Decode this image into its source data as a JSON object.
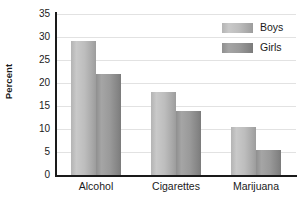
{
  "chart_data": {
    "type": "bar",
    "title": "",
    "xlabel": "",
    "ylabel": "Percent",
    "categories": [
      "Alcohol",
      "Cigarettes",
      "Marijuana"
    ],
    "series": [
      {
        "name": "Boys",
        "color": "#bdbdbd",
        "values": [
          29.1,
          18.0,
          10.4
        ]
      },
      {
        "name": "Girls",
        "color": "#9a9a9a",
        "values": [
          22.0,
          13.9,
          5.5
        ]
      }
    ],
    "ylim": [
      0,
      35
    ],
    "yticks": [
      0,
      5,
      10,
      15,
      20,
      25,
      30,
      35
    ],
    "ytick_labels": [
      "0",
      "5",
      "10",
      "15",
      "20",
      "25",
      "30",
      "35"
    ],
    "grid": true,
    "legend_position": "top-right"
  }
}
